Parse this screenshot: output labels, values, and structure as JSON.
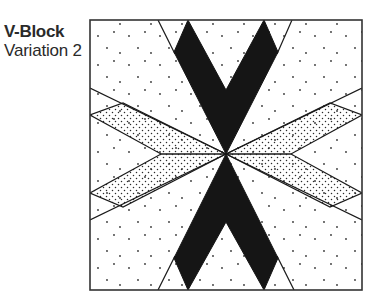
{
  "caption": {
    "title": "V-Block",
    "subtitle": "Variation 2"
  },
  "diagram": {
    "type": "quilt-block",
    "frame": {
      "x": 90,
      "y": 20,
      "width": 272,
      "height": 270
    },
    "colors": {
      "ink": "#1a1a1a",
      "background": "#ffffff",
      "stipple": "#2a2a2a"
    },
    "fills": [
      "solid-black",
      "dense-stipple",
      "sparse-dots"
    ]
  }
}
